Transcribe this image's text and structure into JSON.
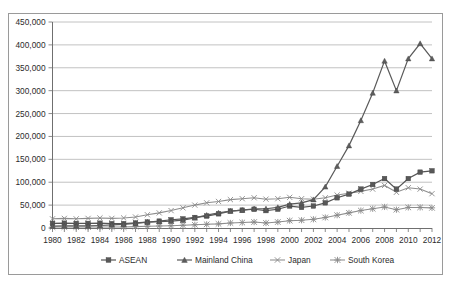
{
  "chart_data": {
    "type": "line",
    "title": "",
    "xlabel": "",
    "ylabel": "",
    "ylim": [
      0,
      450000
    ],
    "xlim": [
      1980,
      2012
    ],
    "grid": true,
    "legend_position": "bottom",
    "y_ticks": [
      "0",
      "50,000",
      "100,000",
      "150,000",
      "200,000",
      "250,000",
      "300,000",
      "350,000",
      "400,000",
      "450,000"
    ],
    "y_tick_values": [
      0,
      50000,
      100000,
      150000,
      200000,
      250000,
      300000,
      350000,
      400000,
      450000
    ],
    "x_tick_labels": [
      "1980",
      "1982",
      "1984",
      "1986",
      "1988",
      "1990",
      "1992",
      "1994",
      "1996",
      "1998",
      "2000",
      "2002",
      "2004",
      "2006",
      "2008",
      "2010",
      "2012"
    ],
    "x": [
      1980,
      1981,
      1982,
      1983,
      1984,
      1985,
      1986,
      1987,
      1988,
      1989,
      1990,
      1991,
      1992,
      1993,
      1994,
      1995,
      1996,
      1997,
      1998,
      1999,
      2000,
      2001,
      2002,
      2003,
      2004,
      2005,
      2006,
      2007,
      2008,
      2009,
      2010,
      2011,
      2012
    ],
    "series": [
      {
        "name": "ASEAN",
        "marker": "square",
        "values": [
          10000,
          10500,
          10000,
          10000,
          10500,
          9500,
          9500,
          11000,
          13000,
          15000,
          18000,
          20000,
          23000,
          26000,
          31000,
          37000,
          39000,
          41000,
          38000,
          41000,
          48000,
          45000,
          48000,
          55000,
          66000,
          74000,
          85000,
          95000,
          108000,
          85000,
          108000,
          122000,
          125000
        ]
      },
      {
        "name": "Mainland China",
        "marker": "triangle",
        "values": [
          4000,
          4500,
          4500,
          4500,
          5500,
          7000,
          8000,
          10000,
          13000,
          14000,
          15000,
          17000,
          22000,
          28000,
          33000,
          37000,
          39000,
          42000,
          42000,
          45000,
          52000,
          55000,
          62000,
          90000,
          135000,
          180000,
          235000,
          295000,
          365000,
          300000,
          370000,
          403000,
          370000
        ]
      },
      {
        "name": "Japan",
        "marker": "x",
        "values": [
          20000,
          21000,
          20000,
          21000,
          22000,
          21000,
          22000,
          24000,
          29000,
          33000,
          38000,
          44000,
          50000,
          55000,
          58000,
          62000,
          64000,
          66000,
          63000,
          64000,
          67000,
          64000,
          63000,
          66000,
          72000,
          76000,
          80000,
          85000,
          93000,
          78000,
          88000,
          85000,
          75000
        ]
      },
      {
        "name": "South Korea",
        "marker": "star",
        "values": [
          2000,
          2000,
          2000,
          2000,
          2000,
          2000,
          2000,
          3000,
          4000,
          4500,
          5000,
          6000,
          7000,
          8000,
          9000,
          11000,
          12000,
          13000,
          11000,
          13000,
          16000,
          17000,
          19000,
          23000,
          28000,
          33000,
          38000,
          42000,
          46000,
          40000,
          45000,
          45000,
          44000
        ]
      }
    ]
  },
  "legend": {
    "items": [
      {
        "label": "ASEAN",
        "marker": "square"
      },
      {
        "label": "Mainland China",
        "marker": "triangle"
      },
      {
        "label": "Japan",
        "marker": "x"
      },
      {
        "label": "South Korea",
        "marker": "star"
      }
    ]
  },
  "colors": {
    "asean": "#585858",
    "china": "#5d5d5d",
    "japan": "#8a8a8a",
    "korea": "#8a8a8a",
    "grid": "#b3b3b3",
    "axis": "#6f6f6f",
    "frame": "#9a9a9a",
    "text": "#2b2b2b",
    "background": "#ffffff"
  }
}
